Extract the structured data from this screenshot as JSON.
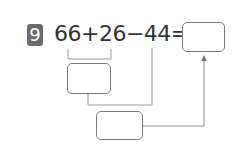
{
  "problem": {
    "number": "9",
    "equation": "66+26−44=",
    "terms": [
      "66",
      "26",
      "44"
    ],
    "operators": [
      "+",
      "−",
      "="
    ],
    "answer_box_value": "",
    "step1_box_value": "",
    "step2_box_value": ""
  },
  "colors": {
    "badge": "#6b6b6b",
    "text": "#333333",
    "lines": "#8a8a8a"
  }
}
